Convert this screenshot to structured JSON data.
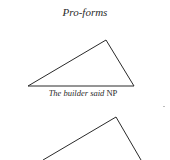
{
  "title": "Pro-forms",
  "diagrams": [
    {
      "label_italic": "The builder said",
      "label_node": "NP",
      "points": "28,86 106,40 134,86"
    },
    {
      "label_italic": "",
      "label_node": "",
      "points": "43,160 116,117 141,160"
    }
  ]
}
